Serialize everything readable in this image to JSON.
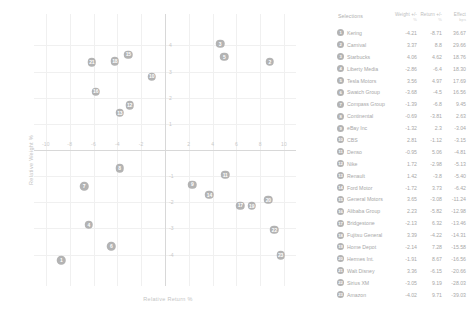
{
  "chart_data": {
    "type": "scatter",
    "title": "",
    "xlabel": "Relative Return %",
    "ylabel": "Relative Weight %",
    "xlim": [
      -11,
      11
    ],
    "ylim": [
      -5.2,
      5.2
    ],
    "xticks": [
      -10,
      -8,
      -6,
      -4,
      -2,
      0,
      2,
      4,
      6,
      8,
      10
    ],
    "yticks": [
      -4,
      -3,
      -2,
      -1,
      0,
      1,
      2,
      3,
      4
    ],
    "grid": true,
    "legend_position": "right-table",
    "points": [
      {
        "id": 1,
        "label": "Kering",
        "x": -8.71,
        "y": -4.21
      },
      {
        "id": 2,
        "label": "Carnival",
        "x": 8.8,
        "y": 3.37
      },
      {
        "id": 3,
        "label": "Starbucks",
        "x": 4.62,
        "y": 4.06
      },
      {
        "id": 4,
        "label": "Liberty Media",
        "x": -6.4,
        "y": -2.86
      },
      {
        "id": 5,
        "label": "Tesla Motors",
        "x": 4.97,
        "y": 3.56
      },
      {
        "id": 6,
        "label": "Swatch Group",
        "x": -4.5,
        "y": -3.68
      },
      {
        "id": 7,
        "label": "Compass Group",
        "x": -6.8,
        "y": -1.39
      },
      {
        "id": 8,
        "label": "Continental",
        "x": -3.81,
        "y": -0.69
      },
      {
        "id": 9,
        "label": "eBay Inc",
        "x": 2.3,
        "y": -1.32
      },
      {
        "id": 10,
        "label": "CBS",
        "x": -1.12,
        "y": 2.81
      },
      {
        "id": 11,
        "label": "Denso",
        "x": 5.06,
        "y": -0.95
      },
      {
        "id": 12,
        "label": "Nike",
        "x": -2.98,
        "y": 1.72
      },
      {
        "id": 13,
        "label": "Renault",
        "x": -3.8,
        "y": 1.42
      },
      {
        "id": 14,
        "label": "Ford Motor",
        "x": 3.73,
        "y": -1.72
      },
      {
        "id": 15,
        "label": "General Motors",
        "x": -3.08,
        "y": 3.65
      },
      {
        "id": 16,
        "label": "Alibaba Group",
        "x": -5.82,
        "y": 2.23
      },
      {
        "id": 17,
        "label": "Bridgestone",
        "x": 6.32,
        "y": -2.13
      },
      {
        "id": 18,
        "label": "Fujitsu General",
        "x": -4.22,
        "y": 3.39
      },
      {
        "id": 19,
        "label": "Home Depot",
        "x": 7.28,
        "y": -2.14
      },
      {
        "id": 20,
        "label": "Hermes Int.",
        "x": 8.67,
        "y": -1.91
      },
      {
        "id": 21,
        "label": "Walt Disney",
        "x": -6.15,
        "y": 3.36
      },
      {
        "id": 22,
        "label": "Sirius XM",
        "x": 9.19,
        "y": -3.05
      },
      {
        "id": 23,
        "label": "Amazon",
        "x": 9.71,
        "y": -4.02
      }
    ]
  },
  "table": {
    "headers": {
      "selections": "Selections",
      "weight": "Weight +/-",
      "weight_sub": "%",
      "return": "Return +/-",
      "return_sub": "%",
      "effect": "Effect",
      "effect_sub": "bps"
    },
    "rows": [
      {
        "id": "1",
        "name": "Kering",
        "weight": "-4.21",
        "return": "-8.71",
        "effect": "36.67"
      },
      {
        "id": "2",
        "name": "Carnival",
        "weight": "3.37",
        "return": "8.8",
        "effect": "29.66"
      },
      {
        "id": "3",
        "name": "Starbucks",
        "weight": "4.06",
        "return": "4.62",
        "effect": "18.76"
      },
      {
        "id": "4",
        "name": "Liberty Media",
        "weight": "-2.86",
        "return": "-6.4",
        "effect": "18.30"
      },
      {
        "id": "5",
        "name": "Tesla Motors",
        "weight": "3.56",
        "return": "4.97",
        "effect": "17.69"
      },
      {
        "id": "6",
        "name": "Swatch Group",
        "weight": "-3.68",
        "return": "-4.5",
        "effect": "16.56"
      },
      {
        "id": "7",
        "name": "Compass Group",
        "weight": "-1.39",
        "return": "-6.8",
        "effect": "9.45"
      },
      {
        "id": "8",
        "name": "Continental",
        "weight": "-0.69",
        "return": "-3.81",
        "effect": "2.63"
      },
      {
        "id": "9",
        "name": "eBay Inc",
        "weight": "-1.32",
        "return": "2.3",
        "effect": "-3.04"
      },
      {
        "id": "10",
        "name": "CBS",
        "weight": "2.81",
        "return": "-1.12",
        "effect": "-3.15"
      },
      {
        "id": "11",
        "name": "Denso",
        "weight": "-0.95",
        "return": "5.06",
        "effect": "-4.81"
      },
      {
        "id": "12",
        "name": "Nike",
        "weight": "1.72",
        "return": "-2.98",
        "effect": "-5.13"
      },
      {
        "id": "13",
        "name": "Renault",
        "weight": "1.42",
        "return": "-3.8",
        "effect": "-5.40"
      },
      {
        "id": "14",
        "name": "Ford Motor",
        "weight": "-1.72",
        "return": "3.73",
        "effect": "-6.42"
      },
      {
        "id": "15",
        "name": "General Motors",
        "weight": "3.65",
        "return": "-3.08",
        "effect": "-11.24"
      },
      {
        "id": "16",
        "name": "Alibaba Group",
        "weight": "2.23",
        "return": "-5.82",
        "effect": "-12.98"
      },
      {
        "id": "17",
        "name": "Bridgestone",
        "weight": "-2.13",
        "return": "6.32",
        "effect": "-13.46"
      },
      {
        "id": "18",
        "name": "Fujitsu General",
        "weight": "3.39",
        "return": "-4.22",
        "effect": "-14.31"
      },
      {
        "id": "19",
        "name": "Home Depot",
        "weight": "-2.14",
        "return": "7.28",
        "effect": "-15.58"
      },
      {
        "id": "20",
        "name": "Hermes Int.",
        "weight": "-1.91",
        "return": "8.67",
        "effect": "-16.56"
      },
      {
        "id": "21",
        "name": "Walt Disney",
        "weight": "3.36",
        "return": "-6.15",
        "effect": "-20.66"
      },
      {
        "id": "22",
        "name": "Sirius XM",
        "weight": "-3.05",
        "return": "9.19",
        "effect": "-28.03"
      },
      {
        "id": "23",
        "name": "Amazon",
        "weight": "-4.02",
        "return": "9.71",
        "effect": "-39.03"
      }
    ]
  },
  "colors": {
    "bubble": "#b3b3b3",
    "grid": "#f0f0f0",
    "axis": "#d8d8d8",
    "text": "#a8a8a8"
  }
}
